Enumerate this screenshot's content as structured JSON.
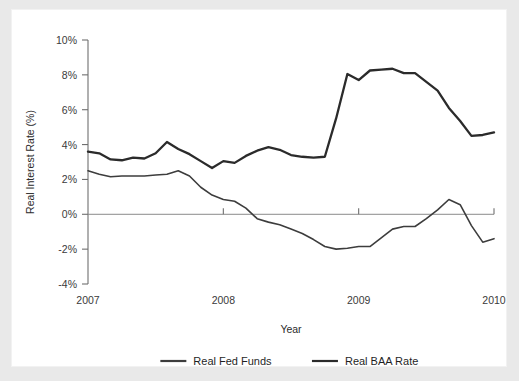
{
  "chart_data": {
    "type": "line",
    "title": "",
    "xlabel": "Year",
    "ylabel": "Real Interest Rate (%)",
    "xlim": [
      2007.0,
      2010.0
    ],
    "ylim": [
      -4,
      10
    ],
    "x_ticks": [
      2007,
      2008,
      2009,
      2010
    ],
    "x_tick_labels": [
      "2007",
      "2008",
      "2009",
      "2010"
    ],
    "y_ticks": [
      -4,
      -2,
      0,
      2,
      4,
      6,
      8,
      10
    ],
    "y_tick_labels": [
      "-4%",
      "-2%",
      "0%",
      "2%",
      "4%",
      "6%",
      "8%",
      "10%"
    ],
    "grid": false,
    "zero_line": true,
    "legend_position": "bottom",
    "x": [
      2007.0,
      2007.0833,
      2007.1667,
      2007.25,
      2007.3333,
      2007.4167,
      2007.5,
      2007.5833,
      2007.6667,
      2007.75,
      2007.8333,
      2007.9167,
      2008.0,
      2008.0833,
      2008.1667,
      2008.25,
      2008.3333,
      2008.4167,
      2008.5,
      2008.5833,
      2008.6667,
      2008.75,
      2008.8333,
      2008.9167,
      2009.0,
      2009.0833,
      2009.1667,
      2009.25,
      2009.3333,
      2009.4167,
      2009.5,
      2009.5833,
      2009.6667,
      2009.75,
      2009.8333,
      2009.9167,
      2010.0
    ],
    "series": [
      {
        "name": "Real Fed Funds",
        "color": "#3d3d3d",
        "width": 1.6,
        "values": [
          2.5,
          2.3,
          2.15,
          2.2,
          2.2,
          2.2,
          2.25,
          2.3,
          2.5,
          2.2,
          1.55,
          1.1,
          0.85,
          0.75,
          0.35,
          -0.25,
          -0.45,
          -0.6,
          -0.85,
          -1.1,
          -1.45,
          -1.85,
          -2.0,
          -1.95,
          -1.85,
          -1.85,
          -1.35,
          -0.85,
          -0.7,
          -0.7,
          -0.25,
          0.25,
          0.85,
          0.55,
          -0.65,
          -1.6,
          -1.4
        ]
      },
      {
        "name": "Real BAA Rate",
        "color": "#2b2b2b",
        "width": 2.3,
        "values": [
          3.6,
          3.5,
          3.15,
          3.1,
          3.25,
          3.2,
          3.5,
          4.15,
          3.75,
          3.45,
          3.05,
          2.65,
          3.05,
          2.95,
          3.35,
          3.65,
          3.85,
          3.7,
          3.4,
          3.3,
          3.25,
          3.3,
          5.5,
          8.05,
          7.7,
          8.25,
          8.3,
          8.35,
          8.1,
          8.1,
          7.6,
          7.1,
          6.1,
          5.35,
          4.5,
          4.55,
          4.7
        ]
      }
    ]
  },
  "legend": {
    "items": [
      {
        "label": "Real Fed Funds",
        "color": "#3d3d3d"
      },
      {
        "label": "Real BAA Rate",
        "color": "#2b2b2b"
      }
    ]
  }
}
